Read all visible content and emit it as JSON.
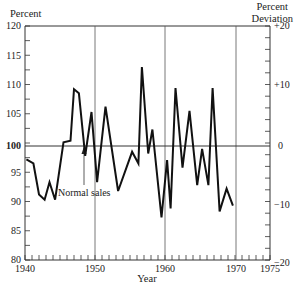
{
  "chart_data": {
    "type": "line",
    "title": "",
    "xlabel": "Year",
    "ylabel": "Percent",
    "y2label": [
      "Percent",
      "Deviation"
    ],
    "xlim": [
      1940,
      1975
    ],
    "ylim": [
      80,
      120
    ],
    "y2lim": [
      -20,
      20
    ],
    "x_ticks": [
      1940,
      1950,
      1960,
      1970,
      1975
    ],
    "y_ticks": [
      80,
      85,
      90,
      95,
      100,
      105,
      110,
      115,
      120
    ],
    "y2_ticks": [
      "+20",
      "+10",
      "0",
      "-10",
      "-20"
    ],
    "grid": {
      "vertical_lines_at": [
        1950,
        1960,
        1970
      ],
      "horizontal_line_at": 100
    },
    "reference_line": {
      "value": 100,
      "label": "Normal sales"
    },
    "series": [
      {
        "name": "Sales (% of normal)",
        "note": "Approximate turning points read from the trace; not a complete year-by-year series.",
        "x": [
          1940.2,
          1941.2,
          1942,
          1942.8,
          1943.5,
          1944.3,
          1945.5,
          1946.5,
          1947,
          1947.7,
          1948.6,
          1949.5,
          1950.3,
          1951.5,
          1953.3,
          1955.3,
          1956.2,
          1956.7,
          1957.6,
          1958.2,
          1959.5,
          1960.3,
          1960.8,
          1961.5,
          1962.5,
          1963.5,
          1964.6,
          1965.3,
          1966.2,
          1966.8,
          1967.8,
          1968.8,
          1969.7,
          1970.6,
          1971.6,
          1972.2,
          1973.2,
          1973.8
        ],
        "values": [
          97.2,
          96.5,
          91.2,
          90.3,
          93.3,
          90.3,
          100.1,
          100.4,
          109.2,
          108.5,
          97.8,
          105.3,
          93.3,
          106.2,
          91.8,
          98.5,
          96.5,
          113,
          98.2,
          102.3,
          87.3,
          97.1,
          88.8,
          109.4,
          95.8,
          105.5,
          92.8,
          99,
          92.8,
          109.4,
          88.3,
          92.2,
          89.3,
          0,
          0,
          0,
          0,
          0
        ]
      }
    ]
  },
  "labels": {
    "y_left_title": "Percent",
    "y_right_title_1": "Percent",
    "y_right_title_2": "Deviation",
    "x_title": "Year",
    "normal_sales": "Normal sales",
    "x_ticks": [
      "1940",
      "1950",
      "1960",
      "1970",
      "1975"
    ],
    "y_ticks": [
      "120",
      "115",
      "110",
      "105",
      "100",
      "95",
      "90",
      "85",
      "80"
    ],
    "y2_ticks": [
      "+20",
      "+10",
      "0",
      "−20",
      "−10"
    ]
  },
  "colors": {
    "line": "#111111",
    "axis": "#333333",
    "grid": "#444444"
  }
}
